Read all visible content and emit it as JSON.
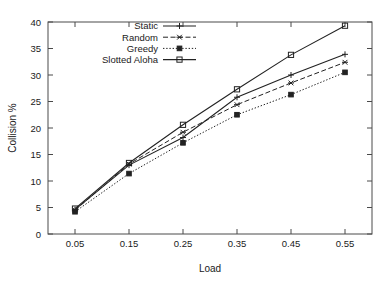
{
  "chart_data": {
    "type": "line",
    "title": "",
    "xlabel": "Load",
    "ylabel": "Collision %",
    "x": [
      0.05,
      0.15,
      0.25,
      0.35,
      0.45,
      0.55
    ],
    "xtick_labels": [
      "0.05",
      "0.15",
      "0.25",
      "0.35",
      "0.45",
      "0.55"
    ],
    "ytick_labels": [
      "0",
      "5",
      "10",
      "15",
      "20",
      "25",
      "30",
      "35",
      "40"
    ],
    "yticks": [
      0,
      5,
      10,
      15,
      20,
      25,
      30,
      35,
      40
    ],
    "xlim": [
      0.0,
      0.6
    ],
    "ylim": [
      0,
      40
    ],
    "grid": false,
    "legend_position": "top-left-inside",
    "series": [
      {
        "name": "Static",
        "values": [
          4.6,
          13.0,
          18.2,
          25.8,
          30.0,
          33.9
        ],
        "marker": "plus",
        "dash": "solid",
        "color": "#222222"
      },
      {
        "name": "Random",
        "values": [
          4.5,
          13.2,
          19.2,
          24.4,
          28.5,
          32.4
        ],
        "marker": "cross",
        "dash": "dashed",
        "color": "#222222"
      },
      {
        "name": "Greedy",
        "values": [
          4.2,
          11.4,
          17.2,
          22.5,
          26.3,
          30.5
        ],
        "marker": "filled-square",
        "dash": "dotted",
        "color": "#222222"
      },
      {
        "name": "Slotted Aloha",
        "values": [
          4.8,
          13.4,
          20.6,
          27.3,
          33.8,
          39.3
        ],
        "marker": "open-square",
        "dash": "solid",
        "color": "#222222"
      }
    ]
  },
  "legend": {
    "entries": [
      {
        "label": "Static"
      },
      {
        "label": "Random"
      },
      {
        "label": "Greedy"
      },
      {
        "label": "Slotted Aloha"
      }
    ]
  },
  "axes": {
    "x_title": "Load",
    "y_title": "Collision %"
  }
}
